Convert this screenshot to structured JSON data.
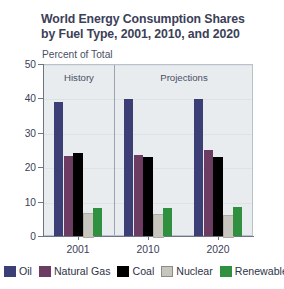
{
  "chart_data": {
    "type": "bar",
    "title": "World Energy Consumption Shares by Fuel Type, 2001, 2010, and 2020",
    "title_lines": [
      "World Energy Consumption Shares",
      "by Fuel Type, 2001, 2010, and 2020"
    ],
    "subtitle": "Percent of Total",
    "xlabel": "",
    "ylabel": "",
    "ylim": [
      0,
      50
    ],
    "yticks": [
      0,
      10,
      20,
      30,
      40,
      50
    ],
    "ytick_labels": [
      "0",
      "10",
      "20",
      "30",
      "40",
      "50"
    ],
    "categories": [
      "2001",
      "2010",
      "2020"
    ],
    "grid": true,
    "legend_position": "bottom",
    "annotations": [
      {
        "text": "History",
        "region": "2001"
      },
      {
        "text": "Projections",
        "region": "2010-2020"
      }
    ],
    "divider_after_category": "2001",
    "series": [
      {
        "name": "Oil",
        "color": "#3c3f75",
        "values": [
          39.0,
          39.8,
          39.7
        ]
      },
      {
        "name": "Natural Gas",
        "color": "#6d3c63",
        "values": [
          23.2,
          23.6,
          24.9
        ]
      },
      {
        "name": "Coal",
        "color": "#000000",
        "values": [
          24.0,
          23.0,
          23.0
        ]
      },
      {
        "name": "Nuclear",
        "color": "#c7c5bd",
        "values": [
          6.8,
          6.5,
          6.0
        ]
      },
      {
        "name": "Renewables",
        "color": "#2f9140",
        "values": [
          8.0,
          8.0,
          8.5
        ]
      }
    ]
  },
  "legend": {
    "items": [
      {
        "label": "Oil"
      },
      {
        "label": "Natural Gas"
      },
      {
        "label": "Coal"
      },
      {
        "label": "Nuclear"
      },
      {
        "label": "Renewables"
      }
    ]
  },
  "colors": {
    "oil": "#3c3f75",
    "natural_gas": "#6d3c63",
    "coal": "#000000",
    "nuclear": "#c7c5bd",
    "renewables": "#2f9140",
    "plot_background": "#e8ecef",
    "axis": "#6d7582",
    "text": "#3b4057"
  }
}
